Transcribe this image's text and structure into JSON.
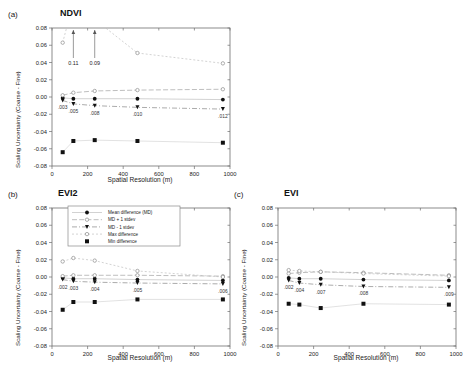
{
  "figure": {
    "panels": [
      {
        "tag": "(a)",
        "title": "NDVI",
        "xlabel": "Spatial Resolution (m)",
        "ylabel": "Scaling Uncertainty (Coarse - Fine)",
        "annotations": [
          ".003",
          ".005",
          ".008",
          ".010",
          ".012"
        ],
        "callouts": [
          "0.11",
          "0.09"
        ]
      },
      {
        "tag": "(b)",
        "title": "EVI2",
        "xlabel": "Spatial Resolution (m)",
        "ylabel": "Scaling Uncertainty (Coarse - Fine)",
        "annotations": [
          ".002",
          ".003",
          ".004",
          ".005",
          ".006"
        ],
        "callouts": []
      },
      {
        "tag": "(c)",
        "title": "EVI",
        "xlabel": "Spatial Resolution (m)",
        "ylabel": "Scaling Uncertainty (Coarse - Fine)",
        "annotations": [
          ".002",
          ".004",
          ".007",
          ".008",
          ".009"
        ],
        "callouts": []
      }
    ],
    "legend": {
      "entries": [
        "Mean difference (MD)",
        "MD + 1 stdev",
        "MD - 1 stdev",
        "Max difference",
        "Min difference"
      ]
    },
    "xticks": [
      "0",
      "200",
      "400",
      "600",
      "800",
      "1000"
    ],
    "yticks": [
      "0.08",
      "0.06",
      "0.04",
      "0.02",
      "0.00",
      "-0.02",
      "-0.04",
      "-0.06",
      "-0.08"
    ]
  },
  "chart_data": [
    {
      "type": "scatter",
      "panel": "a",
      "title": "NDVI",
      "xlabel": "Spatial Resolution (m)",
      "ylabel": "Scaling Uncertainty (Coarse - Fine)",
      "xlim": [
        0,
        1000
      ],
      "ylim": [
        -0.08,
        0.08
      ],
      "xticks": [
        0,
        200,
        400,
        600,
        800,
        1000
      ],
      "yticks": [
        -0.08,
        -0.06,
        -0.04,
        -0.02,
        0.0,
        0.02,
        0.04,
        0.06,
        0.08
      ],
      "grid": false,
      "x": [
        60,
        120,
        240,
        480,
        960
      ],
      "point_labels": [
        ".003",
        ".005",
        ".008",
        ".010",
        ".012"
      ],
      "offscale_callouts": [
        {
          "label": "0.11",
          "x": 120
        },
        {
          "label": "0.09",
          "x": 240
        }
      ],
      "series": [
        {
          "name": "Mean difference (MD)",
          "values": [
            -0.001,
            -0.002,
            -0.002,
            -0.002,
            -0.003
          ]
        },
        {
          "name": "MD + 1 stdev",
          "values": [
            0.002,
            0.005,
            0.007,
            0.008,
            0.009
          ]
        },
        {
          "name": "MD - 1 stdev",
          "values": [
            -0.004,
            -0.008,
            -0.01,
            -0.012,
            -0.014
          ]
        },
        {
          "name": "Max difference",
          "values": [
            0.063,
            0.11,
            0.09,
            0.051,
            0.039
          ]
        },
        {
          "name": "Min difference",
          "values": [
            -0.064,
            -0.051,
            -0.05,
            -0.051,
            -0.053
          ]
        }
      ]
    },
    {
      "type": "scatter",
      "panel": "b",
      "title": "EVI2",
      "xlabel": "Spatial Resolution (m)",
      "ylabel": "Scaling Uncertainty (Coarse - Fine)",
      "xlim": [
        0,
        1000
      ],
      "ylim": [
        -0.08,
        0.08
      ],
      "xticks": [
        0,
        200,
        400,
        600,
        800,
        1000
      ],
      "yticks": [
        -0.08,
        -0.06,
        -0.04,
        -0.02,
        0.0,
        0.02,
        0.04,
        0.06,
        0.08
      ],
      "grid": false,
      "x": [
        60,
        120,
        240,
        480,
        960
      ],
      "point_labels": [
        ".002",
        ".003",
        ".004",
        ".005",
        ".006"
      ],
      "offscale_callouts": [],
      "series": [
        {
          "name": "Mean difference (MD)",
          "values": [
            -0.001,
            -0.002,
            -0.002,
            -0.003,
            -0.004
          ]
        },
        {
          "name": "MD + 1 stdev",
          "values": [
            0.001,
            0.002,
            0.002,
            0.002,
            0.001
          ]
        },
        {
          "name": "MD - 1 stdev",
          "values": [
            -0.003,
            -0.005,
            -0.006,
            -0.007,
            -0.008
          ]
        },
        {
          "name": "Max difference",
          "values": [
            0.018,
            0.022,
            0.019,
            0.007,
            0.0
          ]
        },
        {
          "name": "Min difference",
          "values": [
            -0.038,
            -0.029,
            -0.029,
            -0.026,
            -0.026
          ]
        }
      ]
    },
    {
      "type": "scatter",
      "panel": "c",
      "title": "EVI",
      "xlabel": "Spatial Resolution (m)",
      "ylabel": "Scaling Uncertainty (Coarse - Fine)",
      "xlim": [
        0,
        1000
      ],
      "ylim": [
        -0.08,
        0.08
      ],
      "xticks": [
        0,
        200,
        400,
        600,
        800,
        1000
      ],
      "yticks": [
        -0.08,
        -0.06,
        -0.04,
        -0.02,
        0.0,
        0.02,
        0.04,
        0.06,
        0.08
      ],
      "grid": false,
      "x": [
        60,
        120,
        240,
        480,
        960
      ],
      "point_labels": [
        ".002",
        ".004",
        ".007",
        ".008",
        ".009"
      ],
      "offscale_callouts": [],
      "series": [
        {
          "name": "Mean difference (MD)",
          "values": [
            -0.001,
            -0.002,
            -0.002,
            -0.003,
            -0.004
          ]
        },
        {
          "name": "MD + 1 stdev",
          "values": [
            0.004,
            0.005,
            0.006,
            0.005,
            0.002
          ]
        },
        {
          "name": "MD - 1 stdev",
          "values": [
            -0.004,
            -0.007,
            -0.009,
            -0.011,
            -0.012
          ]
        },
        {
          "name": "Max difference",
          "values": [
            0.008,
            0.007,
            0.006,
            0.004,
            0.001
          ]
        },
        {
          "name": "Min difference",
          "values": [
            -0.031,
            -0.032,
            -0.036,
            -0.031,
            -0.032
          ]
        }
      ]
    }
  ]
}
